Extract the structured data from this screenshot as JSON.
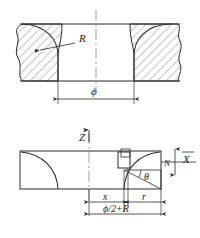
{
  "drawing": {
    "title": "Bore corner radius geometry — sectional and side views",
    "line_color": "#2b2b2b",
    "hatch_color": "#555555",
    "center_line_color": "#777777",
    "background": "#ffffff"
  },
  "upper_view": {
    "name": "cross-section-view",
    "radius_label": "R",
    "diameter_label": "ϕ",
    "hatching": "45-degree section hatch",
    "break_lines": "wavy break at both outer edges"
  },
  "lower_view": {
    "name": "side-profile-view",
    "axis_z_label": "Z",
    "axis_x_label": "X",
    "normal_label": "N",
    "angle_label": "θ",
    "dim_x_label": "x",
    "dim_r_label": "r",
    "dim_total_label": "ϕ/2+R",
    "tool_marker": "square tool insert at arc apex"
  }
}
